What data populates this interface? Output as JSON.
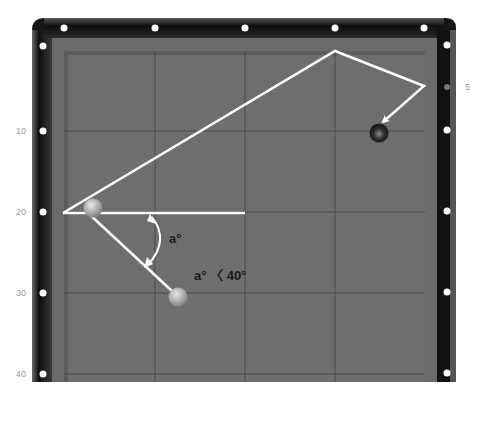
{
  "diagram": {
    "title": "",
    "left_rail_labels": [
      {
        "text": "10",
        "y": 131
      },
      {
        "text": "20",
        "y": 212
      },
      {
        "text": "30",
        "y": 293
      },
      {
        "text": "40",
        "y": 374
      }
    ],
    "right_rail_labels": [
      {
        "text": "5",
        "y": 87
      }
    ],
    "angle_label": "a°",
    "condition_label": "a° 〈 40°",
    "colors": {
      "rail": "#1a1a1a",
      "cushion": "#6a6a6a",
      "cloth": "#6e6e6e",
      "grid": "#4a4a4a",
      "path": "#ffffff",
      "diamond": "#ffffff",
      "label_text": "#1a1a1a",
      "rail_label_text": "#9a9a9a"
    },
    "balls": [
      {
        "name": "cue-ball",
        "x": 93,
        "y": 208,
        "color": "light"
      },
      {
        "name": "object-ball-1",
        "x": 178,
        "y": 297,
        "color": "light"
      },
      {
        "name": "object-ball-2",
        "x": 379,
        "y": 133,
        "color": "dark"
      }
    ],
    "path_points": [
      [
        63,
        213
      ],
      [
        335,
        51
      ],
      [
        424,
        86
      ],
      [
        381,
        121
      ]
    ],
    "reference_line": [
      [
        63,
        213
      ],
      [
        245,
        213
      ]
    ],
    "cut_line": [
      [
        93,
        215
      ],
      [
        178,
        297
      ]
    ]
  }
}
